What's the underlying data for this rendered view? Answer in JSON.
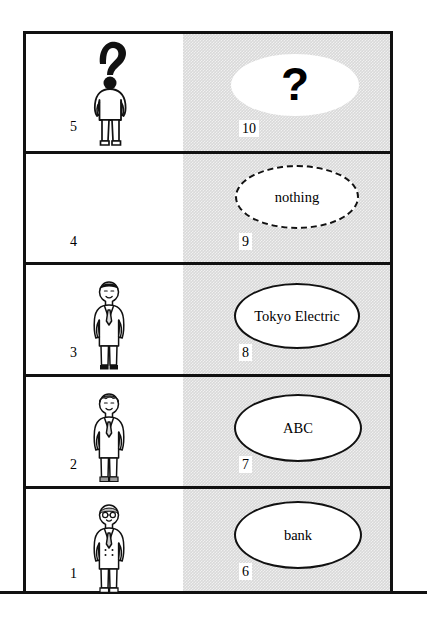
{
  "diagram": {
    "ground_line": "ground",
    "colors": {
      "ink": "#111111",
      "shade": "#d9d9d9",
      "paper": "#ffffff"
    },
    "shade_legend": "right column shaded gray"
  },
  "floors": [
    {
      "floor_label": "5F",
      "left_number": "5",
      "person_name": "",
      "person_kind": "unknown-person-silhouette",
      "left_note": "",
      "bubble_text": "?",
      "bubble_style": "blob",
      "right_number": "10"
    },
    {
      "floor_label": "4F",
      "left_number": "4",
      "person_name": "",
      "person_kind": "none",
      "left_note": "no one",
      "bubble_text": "nothing",
      "bubble_style": "dashed",
      "right_number": "9"
    },
    {
      "floor_label": "3F",
      "left_number": "3",
      "person_name": "Mr. Tanaka",
      "person_kind": "man-suit",
      "left_note": "",
      "bubble_text": "Tokyo Electric",
      "bubble_style": "solid",
      "right_number": "8"
    },
    {
      "floor_label": "2F",
      "left_number": "2",
      "person_name": "Mr. Smith",
      "person_kind": "man-suit",
      "left_note": "",
      "bubble_text": "ABC",
      "bubble_style": "solid",
      "right_number": "7"
    },
    {
      "floor_label": "1F",
      "left_number": "1",
      "person_name": "Mr. Hoffman",
      "person_kind": "man-suit-older",
      "left_note": "",
      "bubble_text": "bank",
      "bubble_style": "solid",
      "right_number": "6"
    }
  ]
}
